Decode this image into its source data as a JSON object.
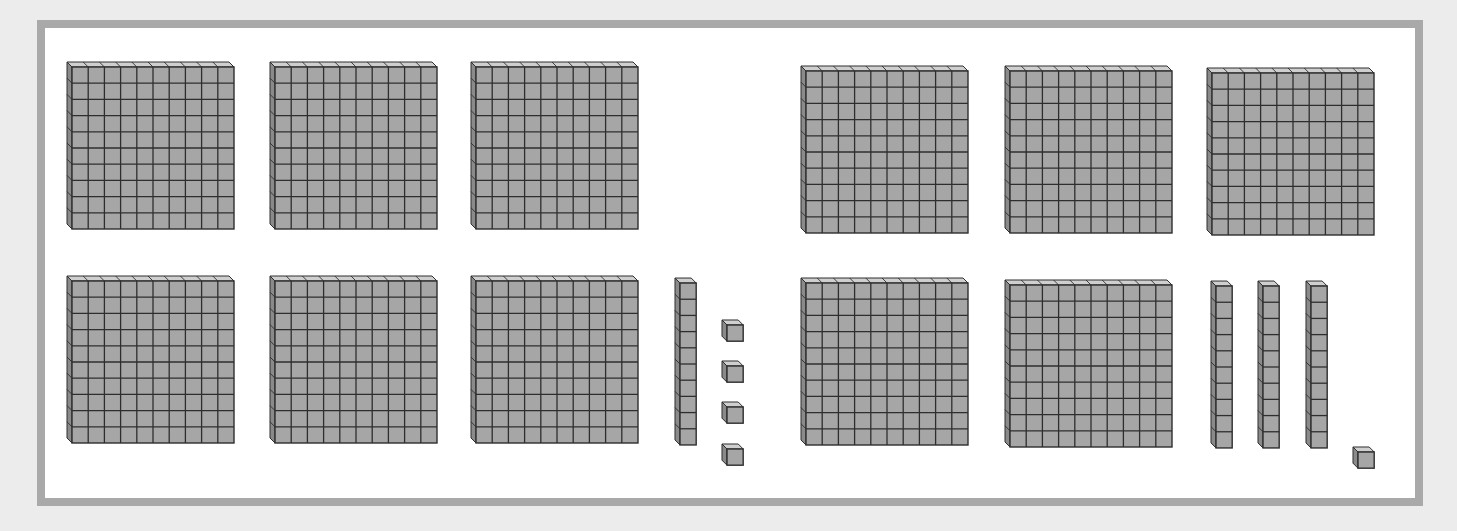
{
  "colors": {
    "background": "#ececec",
    "frame_border": "#a9a9a9",
    "frame_fill": "#ffffff",
    "cube_front": "#a6a6a6",
    "cube_top": "#cfcfcf",
    "cube_side": "#8a8a8a",
    "cube_line": "#2e2e2e"
  },
  "groups": [
    {
      "name": "left-group",
      "value": 614,
      "hundreds": 6,
      "tens": 1,
      "ones": 4,
      "flats": [
        {
          "x": 72,
          "y": 62
        },
        {
          "x": 275,
          "y": 62
        },
        {
          "x": 476,
          "y": 62
        },
        {
          "x": 72,
          "y": 276
        },
        {
          "x": 275,
          "y": 276
        },
        {
          "x": 476,
          "y": 276
        }
      ],
      "rods": [
        {
          "x": 675,
          "y": 278
        }
      ],
      "units": [
        {
          "x": 722,
          "y": 320
        },
        {
          "x": 722,
          "y": 361
        },
        {
          "x": 722,
          "y": 402
        },
        {
          "x": 722,
          "y": 444
        }
      ]
    },
    {
      "name": "right-group",
      "value": 531,
      "hundreds": 5,
      "tens": 3,
      "ones": 1,
      "flats": [
        {
          "x": 806,
          "y": 66
        },
        {
          "x": 1010,
          "y": 66
        },
        {
          "x": 1212,
          "y": 68
        },
        {
          "x": 806,
          "y": 278
        },
        {
          "x": 1010,
          "y": 280
        }
      ],
      "rods": [
        {
          "x": 1211,
          "y": 281
        },
        {
          "x": 1258,
          "y": 281
        },
        {
          "x": 1306,
          "y": 281
        }
      ],
      "units": [
        {
          "x": 1353,
          "y": 447
        }
      ]
    }
  ]
}
